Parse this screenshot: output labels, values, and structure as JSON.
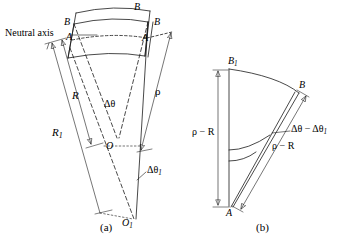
{
  "figure": {
    "colors": {
      "stroke": "#1a1a1a",
      "background": "#ffffff",
      "text": "#000000"
    },
    "panels": [
      {
        "id": "a",
        "caption": "(a)",
        "labels": {
          "neutral_axis": "Neutral axis",
          "b_top_left": "B",
          "b_top_right": "B",
          "b_inner_right": "B",
          "b_outer_right": "B",
          "a_left": "A",
          "a_right": "A",
          "radius_outer": "R",
          "radius_inner": "R",
          "radius_inner_sub": "1",
          "rho": "ρ",
          "delta_theta": "Δθ",
          "delta_theta_1": "Δθ",
          "delta_theta_1_sub": "1",
          "center_o": "O",
          "center_o1": "O",
          "center_o1_sub": "1"
        }
      },
      {
        "id": "b",
        "caption": "(b)",
        "labels": {
          "b1": "B",
          "b1_sub": "1",
          "b": "B",
          "a": "A",
          "rho_minus_r_left": "ρ − R",
          "rho_minus_r_right": "ρ − R",
          "angle_difference": "Δθ − Δθ",
          "angle_difference_sub": "1"
        }
      }
    ]
  }
}
